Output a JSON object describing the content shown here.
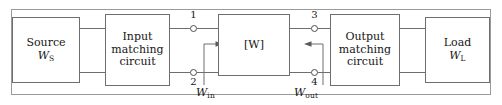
{
  "figure": {
    "frame_color": "#9a9a9a",
    "line_color": "#6e6e6e",
    "text_color": "#161616"
  },
  "blocks": {
    "source": {
      "name": "Source",
      "line1": "Source",
      "symbol_base": "W",
      "symbol_sub": "S"
    },
    "input_match": {
      "line1": "Input",
      "line2": "matching",
      "line3": "circuit"
    },
    "network": {
      "label": "[W]"
    },
    "output_match": {
      "line1": "Output",
      "line2": "matching",
      "line3": "circuit"
    },
    "load": {
      "line1": "Load",
      "symbol_base": "W",
      "symbol_sub": "L"
    }
  },
  "ports": {
    "p1": "1",
    "p2": "2",
    "p3": "3",
    "p4": "4"
  },
  "annotations": {
    "w_in": {
      "base": "W",
      "sub": "in",
      "direction": "right"
    },
    "w_out": {
      "base": "W",
      "sub": "out",
      "direction": "left"
    }
  }
}
